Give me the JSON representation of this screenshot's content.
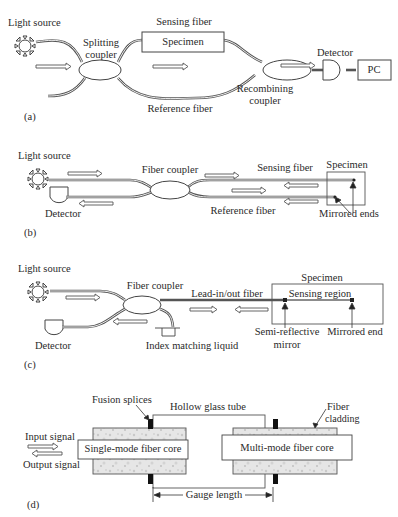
{
  "figure": {
    "panels": [
      {
        "id": "a",
        "tag": "(a)",
        "title": "Mach-Zehnder interferometer",
        "labels": {
          "light_source": "Light source",
          "sensing_fiber": "Sensing fiber",
          "specimen": "Specimen",
          "splitting_coupler_1": "Splitting",
          "splitting_coupler_2": "coupler",
          "reference_fiber": "Reference fiber",
          "recombining_coupler_1": "Recombining",
          "recombining_coupler_2": "coupler",
          "detector": "Detector",
          "pc": "PC"
        }
      },
      {
        "id": "b",
        "tag": "(b)",
        "title": "Michelson interferometer",
        "labels": {
          "light_source": "Light source",
          "fiber_coupler": "Fiber coupler",
          "sensing_fiber": "Sensing fiber",
          "specimen": "Specimen",
          "detector": "Detector",
          "reference_fiber": "Reference fiber",
          "mirrored_ends": "Mirrored ends"
        }
      },
      {
        "id": "c",
        "tag": "(c)",
        "title": "Fabry-Perot interferometer",
        "labels": {
          "light_source": "Light source",
          "fiber_coupler": "Fiber coupler",
          "lead_fiber": "Lead-in/out fiber",
          "specimen": "Specimen",
          "sensing_region": "Sensing region",
          "detector": "Detector",
          "index_matching": "Index matching liquid",
          "semi_reflective_1": "Semi-reflective",
          "semi_reflective_2": "mirror",
          "mirrored_end": "Mirrored end"
        }
      },
      {
        "id": "d",
        "tag": "(d)",
        "title": "Extrinsic Fabry-Perot sensor",
        "labels": {
          "fusion_splices": "Fusion splices",
          "hollow_tube": "Hollow glass tube",
          "fiber_cladding_1": "Fiber",
          "fiber_cladding_2": "cladding",
          "input_signal": "Input signal",
          "output_signal": "Output signal",
          "single_mode_core": "Single-mode fiber core",
          "multi_mode_core": "Multi-mode fiber core",
          "gauge_length": "Gauge length"
        }
      }
    ]
  }
}
